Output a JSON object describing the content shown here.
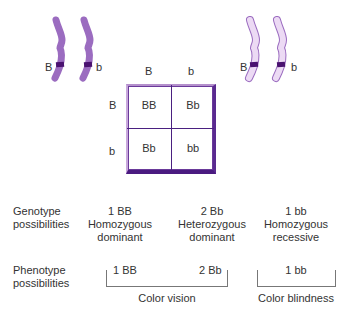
{
  "colors": {
    "chromosome_dark": "#9b6cc0",
    "chromosome_light": "#e8d4f0",
    "chromosome_light_outline": "#9b6cc0",
    "band": "#4a1270",
    "grid_border": "#4a1a80"
  },
  "parents": {
    "left": {
      "chromosomes": [
        {
          "allele": "B",
          "icon": "chromosome-icon"
        },
        {
          "allele": "b",
          "icon": "chromosome-icon"
        }
      ]
    },
    "right": {
      "chromosomes": [
        {
          "allele": "B",
          "icon": "chromosome-icon"
        },
        {
          "allele": "b",
          "icon": "chromosome-icon"
        }
      ]
    }
  },
  "punnett": {
    "col_headers": [
      "B",
      "b"
    ],
    "row_headers": [
      "B",
      "b"
    ],
    "cells": [
      [
        "BB",
        "Bb"
      ],
      [
        "Bb",
        "bb"
      ]
    ]
  },
  "genotype": {
    "label_line1": "Genotype",
    "label_line2": "possibilities",
    "items": [
      {
        "count": "1 BB",
        "line1": "Homozygous",
        "line2": "dominant"
      },
      {
        "count": "2 Bb",
        "line1": "Heterozygous",
        "line2": "dominant"
      },
      {
        "count": "1 bb",
        "line1": "Homozygous",
        "line2": "recessive"
      }
    ]
  },
  "phenotype": {
    "label_line1": "Phenotype",
    "label_line2": "possibilities",
    "groups": [
      {
        "items": [
          "1 BB",
          "2 Bb"
        ],
        "label": "Color vision"
      },
      {
        "items": [
          "1 bb"
        ],
        "label": "Color blindness"
      }
    ]
  }
}
